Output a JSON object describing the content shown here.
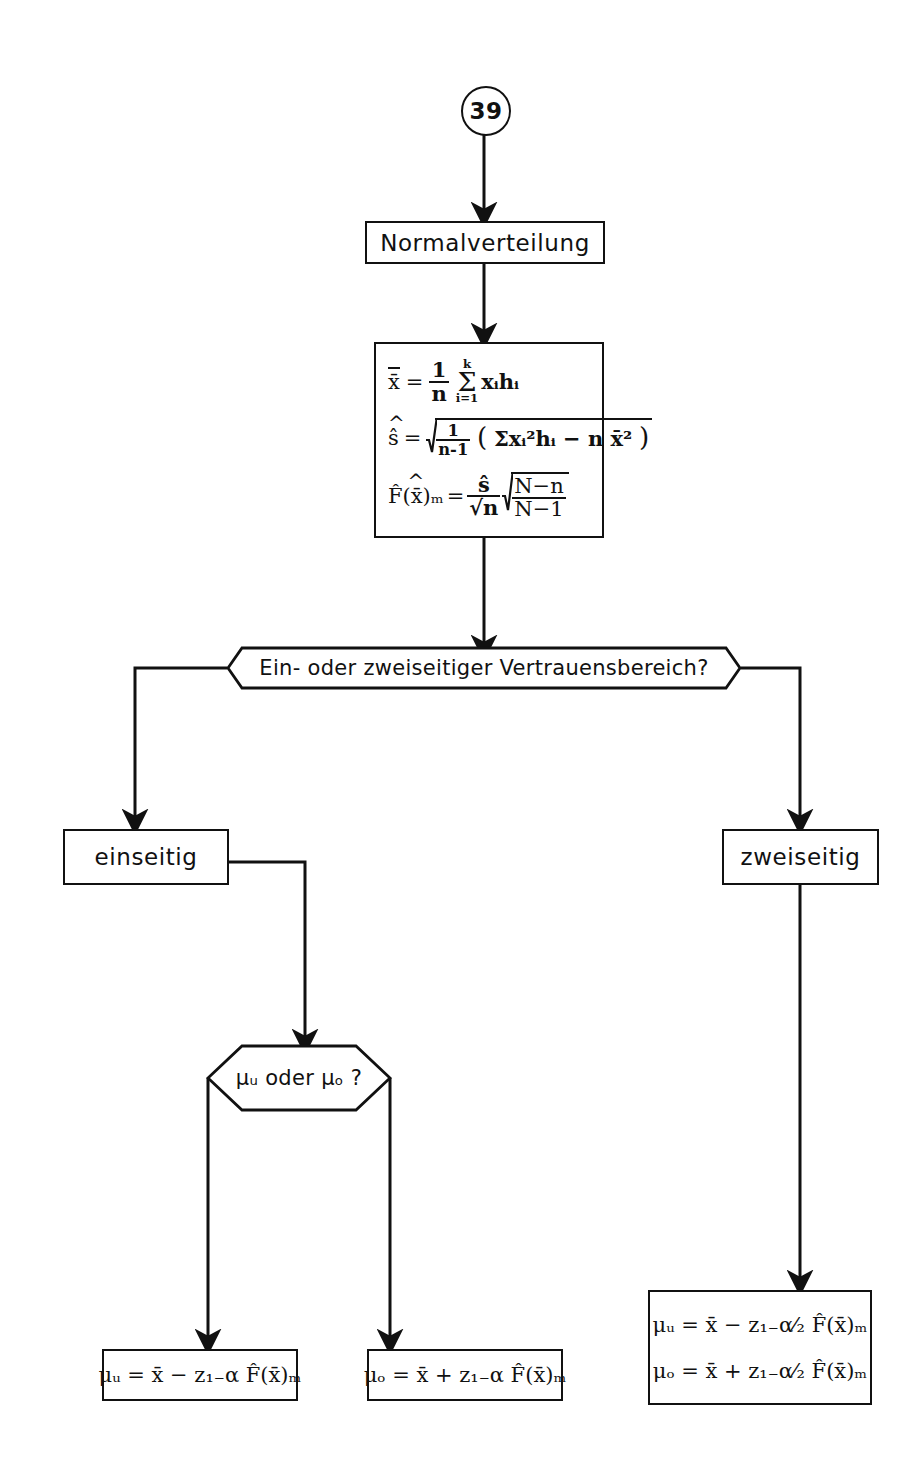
{
  "diagram": {
    "type": "flowchart",
    "language": "de",
    "connector": {
      "label": "39",
      "shape": "circle"
    },
    "nodes": [
      {
        "id": "start",
        "shape": "circle",
        "label": "39"
      },
      {
        "id": "normal",
        "shape": "process",
        "label": "Normalverteilung"
      },
      {
        "id": "formulas",
        "shape": "process",
        "label": "x̄ = 1/n Σ xᵢhᵢ ; ŝ = √(1/(n-1)(Σxᵢ²hᵢ - n x̄²)) ; F̂(x̄)ₘ = ŝ/√n √((N-n)/(N-1))"
      },
      {
        "id": "decision1",
        "shape": "decision",
        "label": "Ein- oder zweiseitiger Vertrauensbereich?"
      },
      {
        "id": "einseitig",
        "shape": "process",
        "label": "einseitig"
      },
      {
        "id": "zweiseitig",
        "shape": "process",
        "label": "zweiseitig"
      },
      {
        "id": "decision2",
        "shape": "hexagon",
        "label": "μᵤ oder μₒ ?"
      },
      {
        "id": "res_mu_u",
        "shape": "process",
        "label": "μᵤ = x̄ − z₁₋α F̂(x̄)ₘ"
      },
      {
        "id": "res_mu_o",
        "shape": "process",
        "label": "μₒ = x̄ + z₁₋α F̂(x̄)ₘ"
      },
      {
        "id": "res_two",
        "shape": "process",
        "label": "μᵤ = x̄ − z₁₋α⁄₂ F̂(x̄)ₘ ; μₒ = x̄ + z₁₋α⁄₂ F̂(x̄)ₘ"
      }
    ],
    "edges": [
      {
        "from": "start",
        "to": "normal"
      },
      {
        "from": "normal",
        "to": "formulas"
      },
      {
        "from": "formulas",
        "to": "decision1"
      },
      {
        "from": "decision1",
        "to": "einseitig",
        "side": "left"
      },
      {
        "from": "decision1",
        "to": "zweiseitig",
        "side": "right"
      },
      {
        "from": "einseitig",
        "to": "decision2"
      },
      {
        "from": "zweiseitig",
        "to": "res_two"
      },
      {
        "from": "decision2",
        "to": "res_mu_u",
        "side": "left"
      },
      {
        "from": "decision2",
        "to": "res_mu_o",
        "side": "right"
      }
    ]
  },
  "labels": {
    "connector_39": "39",
    "normalverteilung": "Normalverteilung",
    "decision_vertrauensbereich": "Ein- oder zweiseitiger Vertrauensbereich?",
    "einseitig": "einseitig",
    "zweiseitig": "zweiseitig",
    "decision_mu": "μᵤ oder μₒ ?"
  },
  "formulas": {
    "mean": {
      "lhs": "x̄",
      "eq": "=",
      "frac_num": "1",
      "frac_den": "n",
      "sum_top": "k",
      "sum_sym": "Σ",
      "sum_bot": "i=1",
      "term": "xᵢhᵢ"
    },
    "stddev": {
      "lhs": "ŝ",
      "eq": "=",
      "inner_frac_num": "1",
      "inner_frac_den": "n-1",
      "paren_open": "(",
      "body": "Σxᵢ²hᵢ − n x̄²",
      "paren_close": ")"
    },
    "stderr": {
      "lhs": "F̂(x̄)ₘ",
      "eq": "=",
      "frac_num": "ŝ",
      "frac_den": "√n",
      "root_num": "N−n",
      "root_den": "N−1"
    },
    "mu_u_one": "μᵤ = x̄ − z₁₋α F̂(x̄)ₘ",
    "mu_o_one": "μₒ = x̄ + z₁₋α F̂(x̄)ₘ",
    "mu_u_two": "μᵤ = x̄ − z₁₋α⁄₂ F̂(x̄)ₘ",
    "mu_o_two": "μₒ = x̄ + z₁₋α⁄₂ F̂(x̄)ₘ"
  },
  "colors": {
    "ink": "#111111",
    "paper": "#ffffff"
  }
}
